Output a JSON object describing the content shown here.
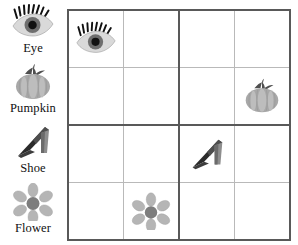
{
  "worksheet": {
    "title": "Picture Sudoku 4x4",
    "type": "picture-sudoku",
    "grid_size": 4,
    "block_size": 2
  },
  "colors": {
    "page_background": "#ffffff",
    "grid_thick_line": "#595959",
    "grid_thin_line": "#b9b9b9",
    "label_text": "#111111",
    "eye_sclera": "#d9d9d9",
    "eye_iris": "#6e6e6e",
    "eye_pupil": "#111111",
    "eye_lash": "#111111",
    "pumpkin_body": "#a8a8a8",
    "pumpkin_rib": "#bdbdbd",
    "pumpkin_stem": "#4f4f4f",
    "shoe_dark": "#2b2b2b",
    "shoe_mid": "#6b6b6b",
    "shoe_light": "#8e8e8e",
    "flower_petal": "#b5b5b5",
    "flower_center": "#7d7d7d"
  },
  "legend": {
    "items": [
      {
        "id": "eye",
        "label": "Eye",
        "icon": "eye-icon"
      },
      {
        "id": "pumpkin",
        "label": "Pumpkin",
        "icon": "pumpkin-icon"
      },
      {
        "id": "shoe",
        "label": "Shoe",
        "icon": "shoe-icon"
      },
      {
        "id": "flower",
        "label": "Flower",
        "icon": "flower-icon"
      }
    ]
  },
  "grid": {
    "rows": [
      [
        {
          "row": 1,
          "col": 1,
          "value": "eye",
          "filled": true
        },
        {
          "row": 1,
          "col": 2,
          "value": null,
          "filled": false
        },
        {
          "row": 1,
          "col": 3,
          "value": null,
          "filled": false
        },
        {
          "row": 1,
          "col": 4,
          "value": null,
          "filled": false
        }
      ],
      [
        {
          "row": 2,
          "col": 1,
          "value": null,
          "filled": false
        },
        {
          "row": 2,
          "col": 2,
          "value": null,
          "filled": false
        },
        {
          "row": 2,
          "col": 3,
          "value": null,
          "filled": false
        },
        {
          "row": 2,
          "col": 4,
          "value": "pumpkin",
          "filled": true
        }
      ],
      [
        {
          "row": 3,
          "col": 1,
          "value": null,
          "filled": false
        },
        {
          "row": 3,
          "col": 2,
          "value": null,
          "filled": false
        },
        {
          "row": 3,
          "col": 3,
          "value": "shoe",
          "filled": true
        },
        {
          "row": 3,
          "col": 4,
          "value": null,
          "filled": false
        }
      ],
      [
        {
          "row": 4,
          "col": 1,
          "value": null,
          "filled": false
        },
        {
          "row": 4,
          "col": 2,
          "value": "flower",
          "filled": true
        },
        {
          "row": 4,
          "col": 3,
          "value": null,
          "filled": false
        },
        {
          "row": 4,
          "col": 4,
          "value": null,
          "filled": false
        }
      ]
    ]
  }
}
